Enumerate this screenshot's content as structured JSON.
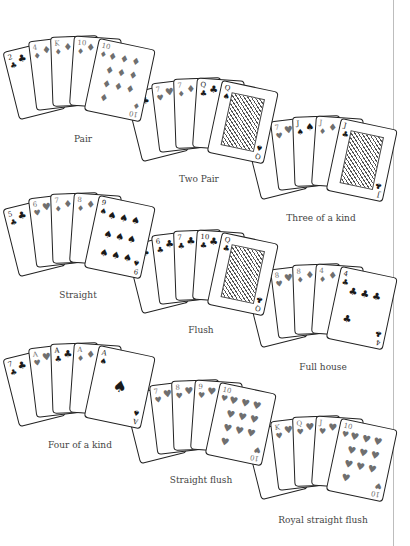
{
  "hands": [
    {
      "label": "Pair",
      "cards": [
        {
          "rank": "2",
          "suit": "♣",
          "tone": "black"
        },
        {
          "rank": "4",
          "suit": "♦",
          "tone": "grey"
        },
        {
          "rank": "K",
          "suit": "♦",
          "tone": "grey",
          "face": true
        },
        {
          "rank": "10",
          "suit": "♦",
          "tone": "grey"
        },
        {
          "rank": "10",
          "suit": "♦",
          "tone": "grey"
        }
      ]
    },
    {
      "label": "Two Pair",
      "cards": [
        {
          "rank": "4",
          "suit": "♣",
          "tone": "black"
        },
        {
          "rank": "7",
          "suit": "♥",
          "tone": "grey"
        },
        {
          "rank": "7",
          "suit": "♦",
          "tone": "grey"
        },
        {
          "rank": "Q",
          "suit": "♣",
          "tone": "black"
        },
        {
          "rank": "Q",
          "suit": "♠",
          "tone": "black",
          "face": true
        }
      ]
    },
    {
      "label": "Three of a kind",
      "cards": [
        {
          "rank": "6",
          "suit": "♦",
          "tone": "grey"
        },
        {
          "rank": "7",
          "suit": "♥",
          "tone": "grey"
        },
        {
          "rank": "J",
          "suit": "♠",
          "tone": "black"
        },
        {
          "rank": "J",
          "suit": "♦",
          "tone": "grey"
        },
        {
          "rank": "J",
          "suit": "♣",
          "tone": "black",
          "face": true
        }
      ]
    },
    {
      "label": "Straight",
      "cards": [
        {
          "rank": "5",
          "suit": "♣",
          "tone": "black"
        },
        {
          "rank": "6",
          "suit": "♥",
          "tone": "grey"
        },
        {
          "rank": "7",
          "suit": "♦",
          "tone": "grey"
        },
        {
          "rank": "8",
          "suit": "♦",
          "tone": "grey"
        },
        {
          "rank": "9",
          "suit": "♠",
          "tone": "black"
        }
      ]
    },
    {
      "label": "Flush",
      "cards": [
        {
          "rank": "2",
          "suit": "♣",
          "tone": "black"
        },
        {
          "rank": "6",
          "suit": "♣",
          "tone": "black"
        },
        {
          "rank": "7",
          "suit": "♣",
          "tone": "black"
        },
        {
          "rank": "10",
          "suit": "♣",
          "tone": "black"
        },
        {
          "rank": "Q",
          "suit": "♣",
          "tone": "black",
          "face": true
        }
      ]
    },
    {
      "label": "Full house",
      "cards": [
        {
          "rank": "8",
          "suit": "♠",
          "tone": "black"
        },
        {
          "rank": "8",
          "suit": "♥",
          "tone": "grey"
        },
        {
          "rank": "8",
          "suit": "♦",
          "tone": "grey"
        },
        {
          "rank": "4",
          "suit": "♦",
          "tone": "grey"
        },
        {
          "rank": "4",
          "suit": "♣",
          "tone": "black"
        }
      ]
    },
    {
      "label": "Four of a kind",
      "cards": [
        {
          "rank": "7",
          "suit": "♣",
          "tone": "black"
        },
        {
          "rank": "A",
          "suit": "♥",
          "tone": "grey"
        },
        {
          "rank": "A",
          "suit": "♣",
          "tone": "black"
        },
        {
          "rank": "A",
          "suit": "♦",
          "tone": "grey"
        },
        {
          "rank": "A",
          "suit": "♠",
          "tone": "black"
        }
      ]
    },
    {
      "label": "Straight flush",
      "cards": [
        {
          "rank": "6",
          "suit": "♥",
          "tone": "grey"
        },
        {
          "rank": "7",
          "suit": "♥",
          "tone": "grey"
        },
        {
          "rank": "8",
          "suit": "♥",
          "tone": "grey"
        },
        {
          "rank": "9",
          "suit": "♥",
          "tone": "grey"
        },
        {
          "rank": "10",
          "suit": "♥",
          "tone": "grey"
        }
      ]
    },
    {
      "label": "Royal straight flush",
      "cards": [
        {
          "rank": "A",
          "suit": "♥",
          "tone": "grey"
        },
        {
          "rank": "K",
          "suit": "♥",
          "tone": "grey",
          "face": true
        },
        {
          "rank": "Q",
          "suit": "♥",
          "tone": "grey",
          "face": true
        },
        {
          "rank": "J",
          "suit": "♥",
          "tone": "grey",
          "face": true
        },
        {
          "rank": "10",
          "suit": "♥",
          "tone": "grey"
        }
      ]
    }
  ],
  "colors": {
    "background": "#ffffff",
    "card_border": "#222222",
    "black_suit": "#1a1a1a",
    "grey_suit": "#6f6f6f",
    "label": "#444444",
    "divider": "#bdbdbd"
  }
}
